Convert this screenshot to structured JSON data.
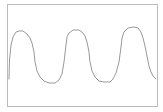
{
  "chart_data": {
    "type": "line",
    "title": "",
    "xlabel": "",
    "ylabel": "",
    "grid": false,
    "legend": null,
    "frame": {
      "x": 7,
      "y": 4,
      "width": 150,
      "height": 102,
      "stroke": "#bbbbbb"
    },
    "series": [
      {
        "name": "waveform",
        "color": "#999999",
        "points": [
          [
            9,
            79
          ],
          [
            9.5,
            60
          ],
          [
            11,
            45
          ],
          [
            13,
            37
          ],
          [
            16,
            32
          ],
          [
            19,
            31
          ],
          [
            23,
            31
          ],
          [
            27,
            34
          ],
          [
            30,
            38
          ],
          [
            32,
            43
          ],
          [
            34,
            52
          ],
          [
            35,
            62
          ],
          [
            37,
            71
          ],
          [
            40,
            77
          ],
          [
            44,
            81
          ],
          [
            49,
            83
          ],
          [
            55,
            83
          ],
          [
            59,
            80
          ],
          [
            62,
            74
          ],
          [
            64,
            62
          ],
          [
            66,
            45
          ],
          [
            67,
            37
          ],
          [
            69,
            33
          ],
          [
            73,
            30
          ],
          [
            79,
            30
          ],
          [
            82,
            32
          ],
          [
            85,
            36
          ],
          [
            87,
            42
          ],
          [
            89,
            52
          ],
          [
            90,
            62
          ],
          [
            92,
            71
          ],
          [
            95,
            77
          ],
          [
            99,
            81
          ],
          [
            104,
            82
          ],
          [
            110,
            82
          ],
          [
            113,
            79
          ],
          [
            116,
            73
          ],
          [
            119,
            62
          ],
          [
            121,
            47
          ],
          [
            122,
            38
          ],
          [
            124,
            32
          ],
          [
            128,
            28
          ],
          [
            134,
            27
          ],
          [
            138,
            28
          ],
          [
            141,
            32
          ],
          [
            143,
            38
          ],
          [
            145,
            46
          ],
          [
            147,
            56
          ],
          [
            149,
            66
          ],
          [
            151,
            72
          ],
          [
            153,
            76
          ],
          [
            156,
            79
          ]
        ]
      }
    ]
  }
}
